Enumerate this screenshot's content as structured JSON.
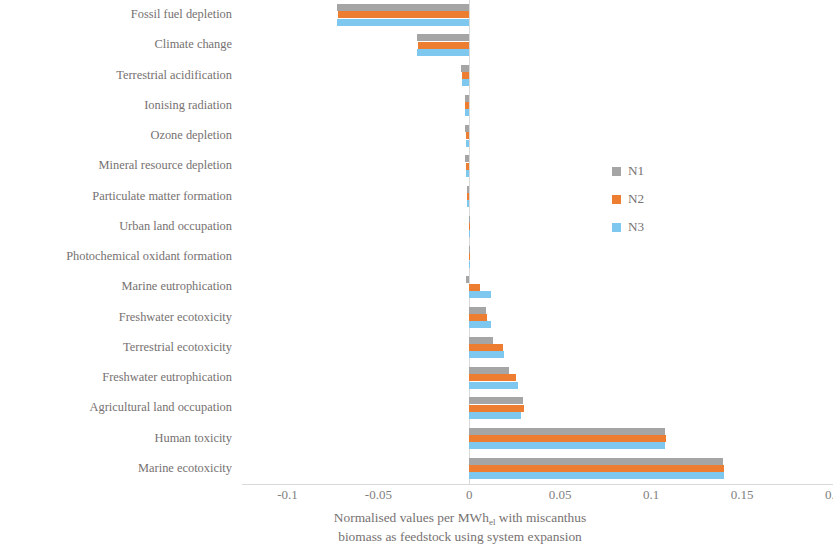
{
  "chart_data": {
    "type": "bar",
    "orientation": "horizontal",
    "title": "",
    "xlabel": "Normalised values per MWhₑ with miscanthus biomass as feedstock using system expansion",
    "xlabel_line1": "Normalised values per MWh",
    "xlabel_subscript": "el",
    "xlabel_line1_tail": " with miscanthus",
    "xlabel_line2": "biomass as feedstock using system expansion",
    "ylabel": "",
    "xlim": [
      -0.125,
      0.2
    ],
    "xticks": [
      -0.1,
      -0.05,
      0,
      0.05,
      0.1,
      0.15,
      0.2
    ],
    "xtick_labels": [
      "-0.1",
      "-0.05",
      "0",
      "0.05",
      "0.1",
      "0.15",
      "0.2"
    ],
    "grid": false,
    "legend_position": "right-middle",
    "categories": [
      "Fossil fuel depletion",
      "Climate change",
      "Terrestrial acidification",
      "Ionising radiation",
      "Ozone depletion",
      "Mineral resource depletion",
      "Particulate matter formation",
      "Urban land occupation",
      "Photochemical oxidant formation",
      "Marine eutrophication",
      "Freshwater ecotoxicity",
      "Terrestrial ecotoxicity",
      "Freshwater eutrophication",
      "Agricultural land occupation",
      "Human toxicity",
      "Marine ecotoxicity"
    ],
    "series": [
      {
        "name": "N1",
        "color": "#a5a5a5",
        "values": [
          -0.0725,
          -0.0285,
          -0.0045,
          -0.0025,
          -0.0022,
          -0.0022,
          -0.0012,
          0.0002,
          0.0003,
          -0.0018,
          0.0092,
          0.0128,
          0.0218,
          0.0298,
          0.1075,
          0.1395
        ]
      },
      {
        "name": "N2",
        "color": "#ed7d31",
        "values": [
          -0.072,
          -0.028,
          -0.0042,
          -0.0022,
          -0.002,
          -0.002,
          -0.001,
          0.0002,
          0.0003,
          0.0058,
          0.0098,
          0.0188,
          0.0255,
          0.0302,
          0.108,
          0.14
        ]
      },
      {
        "name": "N3",
        "color": "#7ec8ef",
        "values": [
          -0.073,
          -0.029,
          -0.004,
          -0.0025,
          -0.002,
          -0.002,
          -0.001,
          0.0002,
          0.0003,
          0.0118,
          0.0118,
          0.019,
          0.0268,
          0.0285,
          0.1075,
          0.1398
        ]
      }
    ]
  },
  "legend": {
    "items": [
      {
        "label": "N1",
        "color": "#a5a5a5"
      },
      {
        "label": "N2",
        "color": "#ed7d31"
      },
      {
        "label": "N3",
        "color": "#7ec8ef"
      }
    ]
  },
  "colors": {
    "n1": "#a5a5a5",
    "n2": "#ed7d31",
    "n3": "#7ec8ef",
    "text": "#767171",
    "axis": "#d9d9d9",
    "background": "#ffffff"
  }
}
